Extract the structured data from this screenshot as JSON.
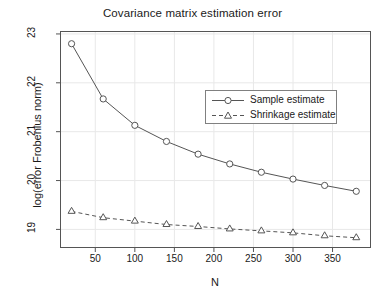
{
  "chart_data": {
    "type": "line",
    "title": "Covariance matrix estimation error",
    "xlabel": "N",
    "ylabel": "log(error Frobenius norm)",
    "x": [
      20,
      60,
      100,
      140,
      180,
      220,
      260,
      300,
      340,
      380
    ],
    "series": [
      {
        "name": "Sample estimate",
        "marker": "circle",
        "linestyle": "solid",
        "color": "#555555",
        "values": [
          22.8,
          21.67,
          21.13,
          20.8,
          20.54,
          20.34,
          20.17,
          20.03,
          19.9,
          19.78
        ]
      },
      {
        "name": "Shrinkage estimate",
        "marker": "triangle",
        "linestyle": "dashed",
        "color": "#555555",
        "values": [
          19.37,
          19.24,
          19.17,
          19.1,
          19.06,
          19.01,
          18.97,
          18.93,
          18.87,
          18.83
        ]
      }
    ],
    "xlim": [
      6,
      398
    ],
    "ylim": [
      18.63,
      23.05
    ],
    "xticks": [
      50,
      100,
      150,
      200,
      250,
      300,
      350
    ],
    "xtick_labels": [
      "50",
      "100",
      "150",
      "200",
      "250",
      "300",
      "350"
    ],
    "yticks": [
      19,
      20,
      21,
      22,
      23
    ],
    "ytick_labels": [
      "19",
      "20",
      "21",
      "22",
      "23"
    ],
    "grid": true,
    "grid_color": "#e8e8e8",
    "legend_position": "center-right",
    "legend": [
      "Sample estimate",
      "Shrinkage estimate"
    ],
    "axis_color": "#555555",
    "background": "#ffffff"
  }
}
